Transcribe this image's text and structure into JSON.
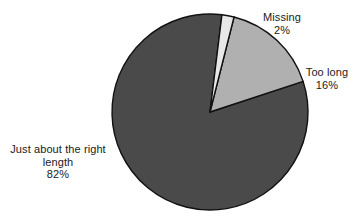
{
  "chart_data": {
    "type": "pie",
    "title": "",
    "subtitle": "",
    "xlabel": "",
    "ylabel": "",
    "legend_position": "none",
    "grid": false,
    "categories": [
      "Missing",
      "Too long",
      "Just about the right length"
    ],
    "values": [
      2,
      16,
      82
    ],
    "value_unit": "%",
    "slices": [
      {
        "label": "Missing",
        "value": 2,
        "value_label": "2%",
        "color": "#e8e8e8",
        "start_angle_deg": 7,
        "end_angle_deg": 14.2
      },
      {
        "label": "Too long",
        "value": 16,
        "value_label": "16%",
        "color": "#b0b0b0",
        "start_angle_deg": 14.2,
        "end_angle_deg": 71.8
      },
      {
        "label": "Just about the right length",
        "value": 82,
        "value_label": "82%",
        "color": "#4a4a4a",
        "start_angle_deg": 71.8,
        "end_angle_deg": 367
      }
    ],
    "annotations": []
  },
  "figure": {
    "background_color": "#ffffff",
    "outline_color": "#111111",
    "center_x": 210,
    "center_y": 112,
    "radius": 98
  },
  "labels": {
    "missing": {
      "name": "Missing",
      "value": "2%"
    },
    "too_long": {
      "name": "Too long",
      "value": "16%"
    },
    "right_length": {
      "name": "Just about the right length",
      "value": "82%"
    }
  }
}
